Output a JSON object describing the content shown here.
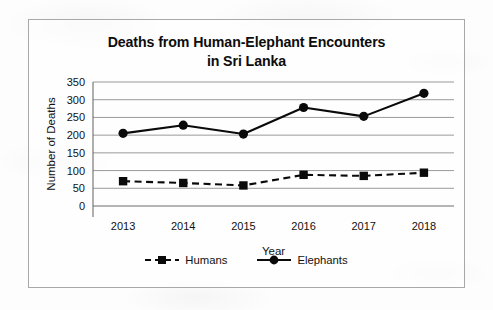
{
  "chart_data": {
    "type": "line",
    "title": "Deaths from Human-Elephant Encounters in Sri Lanka",
    "title_line1": "Deaths from Human-Elephant Encounters",
    "title_line2": "in Sri Lanka",
    "xlabel": "Year",
    "ylabel": "Number of Deaths",
    "categories": [
      "2013",
      "2014",
      "2015",
      "2016",
      "2017",
      "2018"
    ],
    "ylim": [
      0,
      350
    ],
    "yticks": [
      "0",
      "50",
      "100",
      "150",
      "200",
      "250",
      "300",
      "350"
    ],
    "ytick_values": [
      0,
      50,
      100,
      150,
      200,
      250,
      300,
      350
    ],
    "grid": true,
    "legend_position": "bottom",
    "series": [
      {
        "name": "Humans",
        "values": [
          70,
          65,
          58,
          88,
          85,
          94
        ],
        "line_style": "dashed",
        "marker": "square",
        "color": "#0a0a0a"
      },
      {
        "name": "Elephants",
        "values": [
          205,
          228,
          203,
          278,
          253,
          318
        ],
        "line_style": "solid",
        "marker": "circle",
        "color": "#0a0a0a"
      }
    ]
  },
  "legend": {
    "items": [
      {
        "label": "Humans",
        "marker": "square-marker",
        "line": "dashed"
      },
      {
        "label": "Elephants",
        "marker": "circle-marker",
        "line": "solid"
      }
    ]
  },
  "colors": {
    "ink": "#0a0a0a",
    "grid": "#8f8f8f",
    "frame": "#a8a8a8",
    "background": "#fdfdfd"
  }
}
